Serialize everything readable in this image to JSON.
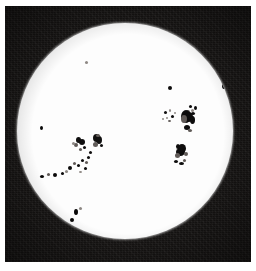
{
  "image": {
    "title": "Solar disk photograph with sunspots",
    "subject": "sun",
    "medium": "black-and-white photographic plate",
    "frame_color": "#151312",
    "disk_color": "#fdfdfd",
    "spot_color": "#100e0d",
    "page_background": "#ffffff",
    "caption": ""
  },
  "plate": {
    "x": 5,
    "y": 6,
    "width": 246,
    "height": 256
  },
  "disk": {
    "center_x": 125,
    "center_y": 131,
    "radius": 108,
    "label": "solar disk"
  },
  "sunspot_groups": [
    {
      "name": "northeast-limb-spot",
      "description": "small isolated spot near upper right limb",
      "spots": [
        {
          "x": 224,
          "y": 86,
          "w": 4,
          "h": 6,
          "type": "umbra"
        }
      ]
    },
    {
      "name": "north-central-spot",
      "description": "small isolated spot north of centre",
      "spots": [
        {
          "x": 170,
          "y": 88,
          "w": 4,
          "h": 4,
          "type": "umbra"
        }
      ]
    },
    {
      "name": "faint-north-spot",
      "description": "very faint speck in upper disk",
      "spots": [
        {
          "x": 86,
          "y": 62,
          "w": 3,
          "h": 3,
          "type": "faint"
        }
      ]
    },
    {
      "name": "main-eastern-group",
      "description": "large complex bipolar group on the right side of the disk",
      "spots": [
        {
          "x": 190,
          "y": 106,
          "w": 3,
          "h": 3,
          "type": "umbra"
        },
        {
          "x": 195,
          "y": 108,
          "w": 3,
          "h": 4,
          "type": "umbra"
        },
        {
          "x": 192,
          "y": 110,
          "w": 3,
          "h": 3,
          "type": "faint"
        },
        {
          "x": 188,
          "y": 112,
          "w": 4,
          "h": 4,
          "type": "penumbra"
        },
        {
          "x": 193,
          "y": 113,
          "w": 4,
          "h": 3,
          "type": "umbra"
        },
        {
          "x": 186,
          "y": 116,
          "w": 10,
          "h": 13,
          "type": "umbra"
        },
        {
          "x": 189,
          "y": 117,
          "w": 8,
          "h": 10,
          "type": "umbra"
        },
        {
          "x": 184,
          "y": 119,
          "w": 6,
          "h": 8,
          "type": "penumbra"
        },
        {
          "x": 192,
          "y": 120,
          "w": 5,
          "h": 8,
          "type": "umbra"
        },
        {
          "x": 187,
          "y": 127,
          "w": 6,
          "h": 5,
          "type": "umbra"
        },
        {
          "x": 190,
          "y": 130,
          "w": 4,
          "h": 3,
          "type": "penumbra"
        }
      ]
    },
    {
      "name": "eastern-trailing-spots",
      "description": "scattered small spots trailing west of the main eastern group",
      "spots": [
        {
          "x": 165,
          "y": 112,
          "w": 3,
          "h": 3,
          "type": "umbra"
        },
        {
          "x": 170,
          "y": 110,
          "w": 2,
          "h": 3,
          "type": "faint"
        },
        {
          "x": 172,
          "y": 116,
          "w": 3,
          "h": 3,
          "type": "umbra"
        },
        {
          "x": 167,
          "y": 118,
          "w": 2,
          "h": 2,
          "type": "faint"
        },
        {
          "x": 175,
          "y": 113,
          "w": 2,
          "h": 2,
          "type": "faint"
        },
        {
          "x": 169,
          "y": 121,
          "w": 3,
          "h": 2,
          "type": "penumbra"
        },
        {
          "x": 163,
          "y": 119,
          "w": 2,
          "h": 2,
          "type": "faint"
        }
      ]
    },
    {
      "name": "southeast-group",
      "description": "compact dark group south-east of disk centre",
      "spots": [
        {
          "x": 178,
          "y": 146,
          "w": 4,
          "h": 5,
          "type": "umbra"
        },
        {
          "x": 182,
          "y": 148,
          "w": 8,
          "h": 9,
          "type": "umbra"
        },
        {
          "x": 180,
          "y": 152,
          "w": 9,
          "h": 8,
          "type": "umbra"
        },
        {
          "x": 177,
          "y": 155,
          "w": 5,
          "h": 5,
          "type": "penumbra"
        },
        {
          "x": 186,
          "y": 154,
          "w": 4,
          "h": 4,
          "type": "penumbra"
        },
        {
          "x": 176,
          "y": 161,
          "w": 4,
          "h": 3,
          "type": "umbra"
        },
        {
          "x": 181,
          "y": 163,
          "w": 5,
          "h": 3,
          "type": "umbra"
        },
        {
          "x": 184,
          "y": 160,
          "w": 3,
          "h": 3,
          "type": "penumbra"
        }
      ]
    },
    {
      "name": "main-western-group",
      "description": "long scattered group extending from centre-left toward the south-west limb",
      "spots": [
        {
          "x": 78,
          "y": 140,
          "w": 5,
          "h": 6,
          "type": "umbra"
        },
        {
          "x": 82,
          "y": 142,
          "w": 6,
          "h": 6,
          "type": "umbra"
        },
        {
          "x": 76,
          "y": 145,
          "w": 4,
          "h": 4,
          "type": "penumbra"
        },
        {
          "x": 84,
          "y": 147,
          "w": 3,
          "h": 3,
          "type": "umbra"
        },
        {
          "x": 80,
          "y": 149,
          "w": 3,
          "h": 3,
          "type": "penumbra"
        },
        {
          "x": 73,
          "y": 143,
          "w": 3,
          "h": 3,
          "type": "faint"
        }
      ]
    },
    {
      "name": "western-leader-spot",
      "description": "dark leader spot of the western group",
      "spots": [
        {
          "x": 96,
          "y": 138,
          "w": 7,
          "h": 8,
          "type": "umbra"
        },
        {
          "x": 99,
          "y": 140,
          "w": 6,
          "h": 8,
          "type": "umbra"
        },
        {
          "x": 95,
          "y": 144,
          "w": 5,
          "h": 5,
          "type": "penumbra"
        },
        {
          "x": 101,
          "y": 145,
          "w": 3,
          "h": 3,
          "type": "umbra"
        },
        {
          "x": 98,
          "y": 135,
          "w": 4,
          "h": 3,
          "type": "penumbra"
        }
      ]
    },
    {
      "name": "western-trail-chain",
      "description": "chain of small spots running down-left from the western group",
      "spots": [
        {
          "x": 90,
          "y": 152,
          "w": 3,
          "h": 3,
          "type": "umbra"
        },
        {
          "x": 88,
          "y": 157,
          "w": 3,
          "h": 3,
          "type": "umbra"
        },
        {
          "x": 86,
          "y": 162,
          "w": 3,
          "h": 3,
          "type": "penumbra"
        },
        {
          "x": 82,
          "y": 160,
          "w": 3,
          "h": 3,
          "type": "umbra"
        },
        {
          "x": 78,
          "y": 165,
          "w": 3,
          "h": 3,
          "type": "umbra"
        },
        {
          "x": 74,
          "y": 163,
          "w": 3,
          "h": 3,
          "type": "penumbra"
        },
        {
          "x": 70,
          "y": 168,
          "w": 4,
          "h": 4,
          "type": "umbra"
        },
        {
          "x": 66,
          "y": 171,
          "w": 3,
          "h": 3,
          "type": "faint"
        },
        {
          "x": 62,
          "y": 173,
          "w": 3,
          "h": 3,
          "type": "umbra"
        },
        {
          "x": 55,
          "y": 175,
          "w": 4,
          "h": 4,
          "type": "umbra"
        },
        {
          "x": 48,
          "y": 174,
          "w": 3,
          "h": 3,
          "type": "penumbra"
        },
        {
          "x": 42,
          "y": 176,
          "w": 4,
          "h": 3,
          "type": "umbra"
        },
        {
          "x": 85,
          "y": 168,
          "w": 3,
          "h": 3,
          "type": "umbra"
        },
        {
          "x": 80,
          "y": 172,
          "w": 3,
          "h": 2,
          "type": "faint"
        }
      ]
    },
    {
      "name": "far-west-spot",
      "description": "isolated small spot near the western limb",
      "spots": [
        {
          "x": 41,
          "y": 128,
          "w": 3,
          "h": 4,
          "type": "umbra"
        }
      ]
    },
    {
      "name": "southwest-group",
      "description": "small pair of spots near the south-west limb",
      "spots": [
        {
          "x": 76,
          "y": 212,
          "w": 4,
          "h": 6,
          "type": "umbra"
        },
        {
          "x": 72,
          "y": 220,
          "w": 4,
          "h": 4,
          "type": "umbra"
        },
        {
          "x": 80,
          "y": 208,
          "w": 3,
          "h": 3,
          "type": "faint"
        }
      ]
    }
  ]
}
